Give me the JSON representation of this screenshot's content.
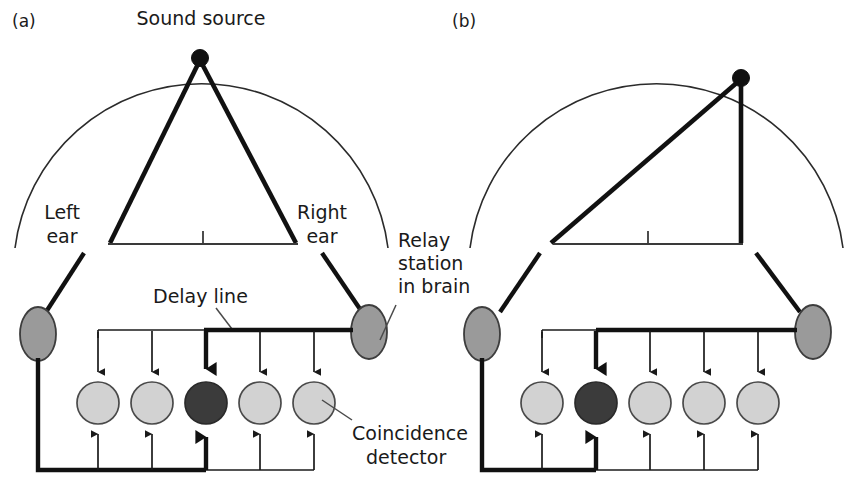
{
  "figure": {
    "background": "#ffffff",
    "width": 850,
    "height": 488,
    "colors": {
      "line": "#111111",
      "arc": "#2b2b2b",
      "relay_fill": "#9a9a9a",
      "detector_inactive": "#d2d2d2",
      "detector_active": "#3b3b3b",
      "text": "#1a1a1a"
    }
  },
  "panels": [
    {
      "key": "a",
      "label": "(a)",
      "labels": {
        "sound_source": "Sound source",
        "left_ear_line1": "Left",
        "left_ear_line2": "ear",
        "right_ear_line1": "Right",
        "right_ear_line2": "ear",
        "relay_line1": "Relay",
        "relay_line2": "station",
        "relay_line3": "in brain",
        "delay_line": "Delay line",
        "coincidence_line1": "Coincidence",
        "coincidence_line2": "detector"
      },
      "source_position": "center",
      "detectors": [
        {
          "index": 1,
          "state": "inactive"
        },
        {
          "index": 2,
          "state": "inactive"
        },
        {
          "index": 3,
          "state": "active"
        },
        {
          "index": 4,
          "state": "inactive"
        },
        {
          "index": 5,
          "state": "inactive"
        }
      ],
      "active_detector_index": 3,
      "detector_count": 5
    },
    {
      "key": "b",
      "label": "(b)",
      "labels": {},
      "source_position": "right",
      "detectors": [
        {
          "index": 1,
          "state": "inactive"
        },
        {
          "index": 2,
          "state": "active"
        },
        {
          "index": 3,
          "state": "inactive"
        },
        {
          "index": 4,
          "state": "inactive"
        },
        {
          "index": 5,
          "state": "inactive"
        }
      ],
      "active_detector_index": 2,
      "detector_count": 5
    }
  ]
}
